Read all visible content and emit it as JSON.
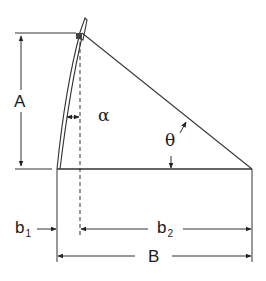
{
  "diagram": {
    "type": "geometry-dimension-diagram",
    "labels": {
      "A": "A",
      "alpha": "α",
      "theta": "θ",
      "b1_main": "b",
      "b1_sub": "1",
      "b2_main": "b",
      "b2_sub": "2",
      "B": "B"
    },
    "colors": {
      "line": "#333333",
      "background": "#ffffff"
    }
  }
}
